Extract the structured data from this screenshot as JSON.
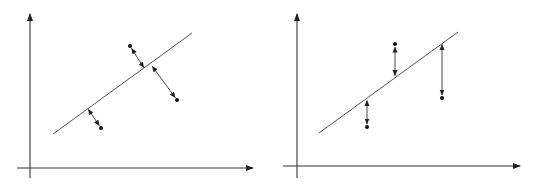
{
  "diagram": {
    "colors": {
      "stroke": "#333333",
      "line": "#555555",
      "background": "#ffffff"
    },
    "panels": [
      {
        "id": "left",
        "residual_type": "perpendicular",
        "y_axis": {
          "x": 30,
          "y_top": 14,
          "y_bottom": 178
        },
        "x_axis": {
          "y": 168,
          "x_left": 17,
          "x_right": 253
        },
        "fit_line": {
          "x1": 53,
          "y1": 134,
          "x2": 192,
          "y2": 33
        },
        "points": [
          {
            "x": 130,
            "y": 46,
            "foot_x": 144,
            "foot_y": 68
          },
          {
            "x": 177,
            "y": 100,
            "foot_x": 152,
            "foot_y": 66
          },
          {
            "x": 101,
            "y": 128,
            "foot_x": 88,
            "foot_y": 109
          }
        ]
      },
      {
        "id": "right",
        "residual_type": "vertical",
        "y_axis": {
          "x": 297,
          "y_top": 14,
          "y_bottom": 178
        },
        "x_axis": {
          "y": 166,
          "x_left": 283,
          "x_right": 520
        },
        "fit_line": {
          "x1": 319,
          "y1": 133,
          "x2": 458,
          "y2": 32
        },
        "points": [
          {
            "x": 395,
            "y": 44,
            "foot_x": 395,
            "foot_y": 76
          },
          {
            "x": 442,
            "y": 98,
            "foot_x": 442,
            "foot_y": 44
          },
          {
            "x": 367,
            "y": 127,
            "foot_x": 367,
            "foot_y": 100
          }
        ]
      }
    ]
  }
}
